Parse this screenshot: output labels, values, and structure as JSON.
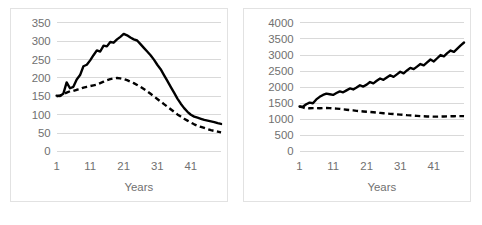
{
  "figure": {
    "background_color": "#ffffff",
    "panel_border_color": "#e2e2e2",
    "gridline_color": "#d9d9d9",
    "tick_text_color": "#707070",
    "series_color": "#000000"
  },
  "chart_data": [
    {
      "id": "left-chart",
      "type": "line",
      "title": "",
      "xlabel": "Years",
      "ylabel": "",
      "xlim": [
        1,
        50
      ],
      "ylim": [
        0,
        350
      ],
      "grid": true,
      "legend": "none",
      "yticks": [
        350,
        300,
        250,
        200,
        150,
        100,
        50,
        0
      ],
      "ytick_labels": [
        "350",
        "300",
        "250",
        "200",
        "150",
        "100",
        "50",
        "0"
      ],
      "xticks": [
        1,
        11,
        21,
        31,
        41
      ],
      "xtick_labels": [
        "1",
        "11",
        "21",
        "31",
        "41"
      ],
      "x": [
        1,
        2,
        3,
        4,
        5,
        6,
        7,
        8,
        9,
        10,
        11,
        12,
        13,
        14,
        15,
        16,
        17,
        18,
        19,
        20,
        21,
        22,
        23,
        24,
        25,
        26,
        27,
        28,
        29,
        30,
        31,
        32,
        33,
        34,
        35,
        36,
        37,
        38,
        39,
        40,
        41,
        42,
        43,
        44,
        45,
        46,
        47,
        48,
        49,
        50
      ],
      "series": [
        {
          "name": "solid-series",
          "style": "solid",
          "values": [
            152,
            151,
            157,
            188,
            172,
            176,
            196,
            208,
            232,
            236,
            248,
            262,
            275,
            272,
            288,
            286,
            298,
            296,
            305,
            312,
            320,
            316,
            310,
            305,
            302,
            292,
            282,
            272,
            262,
            250,
            236,
            224,
            208,
            192,
            176,
            160,
            144,
            130,
            118,
            108,
            100,
            95,
            92,
            89,
            86,
            84,
            82,
            80,
            77,
            75
          ]
        },
        {
          "name": "dashed-series",
          "style": "dashed",
          "values": [
            150,
            152,
            156,
            160,
            164,
            165,
            168,
            170,
            174,
            176,
            178,
            180,
            182,
            186,
            190,
            194,
            197,
            199,
            200,
            199,
            197,
            194,
            190,
            186,
            181,
            176,
            170,
            164,
            157,
            150,
            143,
            136,
            129,
            122,
            115,
            108,
            101,
            95,
            89,
            84,
            79,
            74,
            70,
            67,
            64,
            61,
            58,
            56,
            54,
            52
          ]
        }
      ]
    },
    {
      "id": "right-chart",
      "type": "line",
      "title": "",
      "xlabel": "Years",
      "ylabel": "",
      "xlim": [
        1,
        50
      ],
      "ylim": [
        0,
        4000
      ],
      "grid": true,
      "legend": "none",
      "yticks": [
        4000,
        3500,
        3000,
        2500,
        2000,
        1500,
        1000,
        500,
        0
      ],
      "ytick_labels": [
        "4000",
        "3500",
        "3000",
        "2500",
        "2000",
        "1500",
        "1000",
        "500",
        "0"
      ],
      "xticks": [
        1,
        11,
        21,
        31,
        41
      ],
      "xtick_labels": [
        "1",
        "11",
        "21",
        "31",
        "41"
      ],
      "x": [
        1,
        2,
        3,
        4,
        5,
        6,
        7,
        8,
        9,
        10,
        11,
        12,
        13,
        14,
        15,
        16,
        17,
        18,
        19,
        20,
        21,
        22,
        23,
        24,
        25,
        26,
        27,
        28,
        29,
        30,
        31,
        32,
        33,
        34,
        35,
        36,
        37,
        38,
        39,
        40,
        41,
        42,
        43,
        44,
        45,
        46,
        47,
        48,
        49,
        50
      ],
      "series": [
        {
          "name": "solid-series",
          "style": "solid",
          "values": [
            1400,
            1390,
            1470,
            1520,
            1500,
            1620,
            1700,
            1760,
            1800,
            1780,
            1760,
            1820,
            1870,
            1840,
            1900,
            1960,
            1930,
            1990,
            2060,
            2020,
            2080,
            2160,
            2120,
            2200,
            2270,
            2230,
            2300,
            2370,
            2320,
            2400,
            2480,
            2430,
            2520,
            2600,
            2560,
            2640,
            2720,
            2680,
            2770,
            2860,
            2800,
            2900,
            3000,
            2960,
            3060,
            3140,
            3100,
            3200,
            3300,
            3390
          ]
        },
        {
          "name": "dashed-series",
          "style": "dashed",
          "values": [
            1400,
            1370,
            1340,
            1345,
            1350,
            1348,
            1345,
            1350,
            1352,
            1348,
            1340,
            1335,
            1325,
            1310,
            1300,
            1290,
            1280,
            1265,
            1255,
            1245,
            1235,
            1228,
            1220,
            1210,
            1200,
            1190,
            1180,
            1172,
            1165,
            1155,
            1148,
            1140,
            1130,
            1122,
            1115,
            1108,
            1100,
            1095,
            1090,
            1088,
            1085,
            1085,
            1088,
            1090,
            1092,
            1095,
            1098,
            1100,
            1102,
            1100
          ]
        }
      ]
    }
  ]
}
